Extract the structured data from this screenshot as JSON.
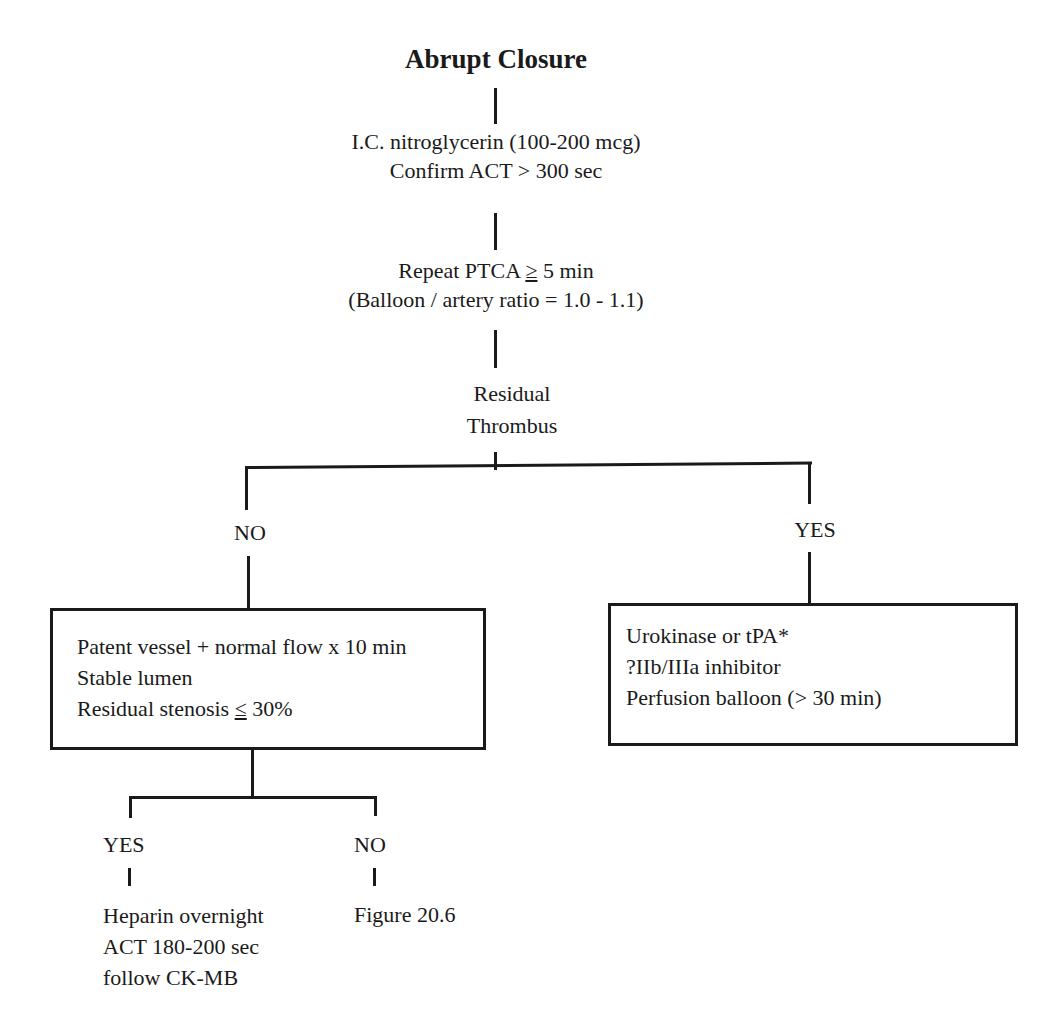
{
  "diagram": {
    "title": "Abrupt Closure",
    "steps": [
      {
        "id": "nitro",
        "lines": [
          "I.C. nitroglycerin (100-200 mcg)",
          "Confirm ACT > 300 sec"
        ]
      },
      {
        "id": "ptca",
        "line1_prefix": "Repeat PTCA ",
        "line1_symbol": "≥",
        "line1_suffix": " 5 min",
        "line2": "(Balloon / artery ratio = 1.0 - 1.1)"
      },
      {
        "id": "decision",
        "lines": [
          "Residual",
          "Thrombus"
        ]
      }
    ],
    "branches": {
      "no": {
        "label": "NO",
        "box": {
          "line1": "Patent vessel + normal flow x 10 min",
          "line2": "Stable lumen",
          "line3_prefix": "Residual stenosis ",
          "line3_symbol": "≤",
          "line3_suffix": " 30%"
        },
        "sub_branches": {
          "yes": {
            "label": "YES",
            "lines": [
              "Heparin overnight",
              "ACT 180-200 sec",
              "follow CK-MB"
            ]
          },
          "no": {
            "label": "NO",
            "lines": [
              "Figure 20.6"
            ]
          }
        }
      },
      "yes": {
        "label": "YES",
        "box": {
          "lines": [
            "Urokinase or tPA*",
            "?IIb/IIIa inhibitor",
            "Perfusion balloon (> 30 min)"
          ]
        }
      }
    },
    "colors": {
      "ink": "#1a1a1a",
      "background": "#ffffff"
    }
  }
}
